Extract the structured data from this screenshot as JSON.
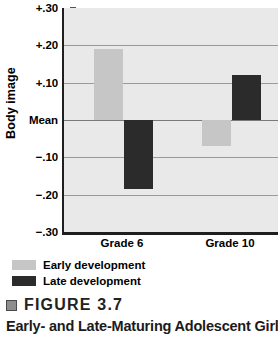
{
  "figure": {
    "marker_icon": "gray-square-icon",
    "number_label": "FIGURE 3.7",
    "title_line": "Early- and Late-Maturing Adolescent Girls’"
  },
  "legend": {
    "position": "below-plot-left",
    "entries": [
      {
        "label": "Early development",
        "color": "#c6c6c6",
        "swatch_icon": "legend-swatch-early"
      },
      {
        "label": "Late development",
        "color": "#2b2b2b",
        "swatch_icon": "legend-swatch-late"
      }
    ]
  },
  "chart_data": {
    "type": "bar",
    "title": "",
    "subtitle": "",
    "xlabel": "",
    "ylabel": "Body image",
    "categories": [
      "Grade 6",
      "Grade 10"
    ],
    "series": [
      {
        "name": "Early development",
        "color": "#c6c6c6",
        "values": [
          0.19,
          -0.07
        ]
      },
      {
        "name": "Late development",
        "color": "#2b2b2b",
        "values": [
          -0.185,
          0.12
        ]
      }
    ],
    "ylim": [
      -0.3,
      0.3
    ],
    "yticks": [
      0.3,
      0.2,
      0.1,
      0.0,
      -0.1,
      -0.2,
      -0.3
    ],
    "ytick_labels": [
      "+.30",
      "+.20",
      "+.10",
      "Mean",
      "−.10",
      "−.20",
      "−.30"
    ],
    "zero_label": "Mean",
    "grid": true,
    "legend_position": "bottom-left",
    "panel_color": "#e9e9e9",
    "axis_color": "#1f1f1f",
    "grid_color": "#9a9a9a"
  }
}
